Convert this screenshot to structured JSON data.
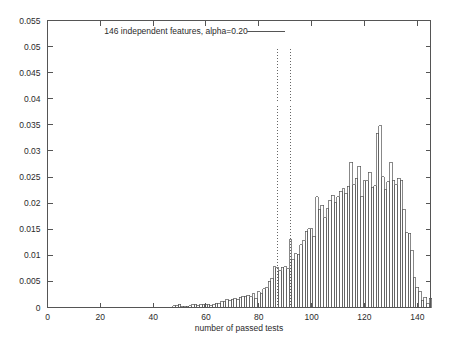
{
  "chart_data": {
    "type": "bar",
    "title": "",
    "subtitle": "",
    "xlabel": "number of passed tests",
    "ylabel": "",
    "xlim": [
      0,
      145
    ],
    "ylim": [
      0,
      0.055
    ],
    "grid": false,
    "legend_position": "top-center",
    "legend": [
      {
        "label": "146 independent features, alpha=0.20",
        "style": "line",
        "color": "#555555"
      }
    ],
    "x_ticks": [
      {
        "value": 0,
        "label": "0"
      },
      {
        "value": 20,
        "label": "20"
      },
      {
        "value": 40,
        "label": "40"
      },
      {
        "value": 60,
        "label": "60"
      },
      {
        "value": 80,
        "label": "80"
      },
      {
        "value": 100,
        "label": "100"
      },
      {
        "value": 120,
        "label": "120"
      },
      {
        "value": 140,
        "label": "140"
      }
    ],
    "y_ticks": [
      {
        "value": 0,
        "label": "0"
      },
      {
        "value": 0.005,
        "label": "0.005"
      },
      {
        "value": 0.01,
        "label": "0.01"
      },
      {
        "value": 0.015,
        "label": "0.015"
      },
      {
        "value": 0.02,
        "label": "0.02"
      },
      {
        "value": 0.025,
        "label": "0.025"
      },
      {
        "value": 0.03,
        "label": "0.03"
      },
      {
        "value": 0.035,
        "label": "0.035"
      },
      {
        "value": 0.04,
        "label": "0.04"
      },
      {
        "value": 0.045,
        "label": "0.045"
      },
      {
        "value": 0.05,
        "label": "0.05"
      },
      {
        "value": 0.055,
        "label": "0.055"
      }
    ],
    "annotations": [
      {
        "name": "threshold-line-left",
        "type": "vline",
        "x": 87,
        "y_from": 0,
        "y_to": 0.05,
        "style": "dotted"
      },
      {
        "name": "threshold-line-right",
        "type": "vline",
        "x": 92,
        "y_from": 0,
        "y_to": 0.05,
        "style": "dotted"
      }
    ],
    "bin_width": 1,
    "categories": [
      48,
      49,
      50,
      51,
      52,
      53,
      54,
      55,
      56,
      57,
      58,
      59,
      60,
      61,
      62,
      63,
      64,
      65,
      66,
      67,
      68,
      69,
      70,
      71,
      72,
      73,
      74,
      75,
      76,
      77,
      78,
      79,
      80,
      81,
      82,
      83,
      84,
      85,
      86,
      87,
      88,
      89,
      90,
      91,
      92,
      93,
      94,
      95,
      96,
      97,
      98,
      99,
      100,
      101,
      102,
      103,
      104,
      105,
      106,
      107,
      108,
      109,
      110,
      111,
      112,
      113,
      114,
      115,
      116,
      117,
      118,
      119,
      120,
      121,
      122,
      123,
      124,
      125,
      126,
      127,
      128,
      129,
      130,
      131,
      132,
      133,
      134,
      135,
      136,
      137,
      138,
      139,
      140,
      141,
      142,
      143,
      144,
      145
    ],
    "values": [
      0.0003,
      0.0004,
      0.0006,
      0.0002,
      0.0002,
      0.0002,
      0.0003,
      0.0005,
      0.0006,
      0.0004,
      0.0005,
      0.0006,
      0.0005,
      0.0006,
      0.0004,
      0.0006,
      0.0008,
      0.0008,
      0.0012,
      0.0011,
      0.0016,
      0.0014,
      0.0016,
      0.0018,
      0.0016,
      0.002,
      0.0022,
      0.0022,
      0.0023,
      0.0021,
      0.0026,
      0.0018,
      0.003,
      0.0026,
      0.0036,
      0.0038,
      0.005,
      0.0056,
      0.0078,
      0.0076,
      0.007,
      0.0077,
      0.0078,
      0.0074,
      0.013,
      0.0092,
      0.0103,
      0.0102,
      0.012,
      0.0128,
      0.0146,
      0.0151,
      0.0151,
      0.0137,
      0.0212,
      0.0188,
      0.0196,
      0.0172,
      0.0189,
      0.0206,
      0.0215,
      0.0201,
      0.0212,
      0.0223,
      0.0228,
      0.0219,
      0.0232,
      0.0278,
      0.0235,
      0.0248,
      0.0271,
      0.0213,
      0.0243,
      0.0243,
      0.0259,
      0.023,
      0.0233,
      0.0334,
      0.0348,
      0.0251,
      0.0226,
      0.0241,
      0.0278,
      0.0244,
      0.0235,
      0.0248,
      0.0244,
      0.0188,
      0.0143,
      0.0142,
      0.011,
      0.0057,
      0.0039,
      0.0031,
      0.0014,
      0.002,
      0.0008,
      0.0018
    ]
  },
  "axes": {
    "x_axis_name": "number of passed tests",
    "y_axis_name": ""
  }
}
